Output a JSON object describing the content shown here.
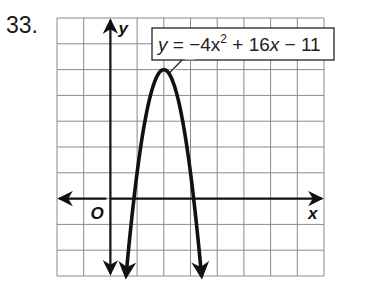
{
  "problem": {
    "number": "33."
  },
  "chart_data": {
    "type": "line",
    "title": "",
    "equation_label": "y = −4x² + 16x − 11",
    "function": {
      "a": -4,
      "b": 16,
      "c": -11
    },
    "xlabel": "x",
    "ylabel": "y",
    "origin_label": "O",
    "xlim": [
      -2,
      8
    ],
    "ylim": [
      -3,
      7
    ],
    "grid": true,
    "grid_step": 1,
    "vertex": [
      2,
      5
    ],
    "roots": [
      0.88,
      3.12
    ],
    "x": [
      0.59,
      1.0,
      1.5,
      2.0,
      2.5,
      3.0,
      3.41
    ],
    "series": [
      {
        "name": "y = −4x² + 16x − 11",
        "values": [
          -3.0,
          1.0,
          4.0,
          5.0,
          4.0,
          1.0,
          -3.0
        ]
      }
    ],
    "colors": {
      "curve": "#111111",
      "grid": "#8a8a8a",
      "axis": "#111111"
    }
  },
  "labels": {
    "eq_y": "y",
    "eq_rest": " = −4x",
    "eq_exp": "2",
    "eq_tail1": " + 16",
    "eq_x": "x",
    "eq_tail2": " − 11"
  }
}
